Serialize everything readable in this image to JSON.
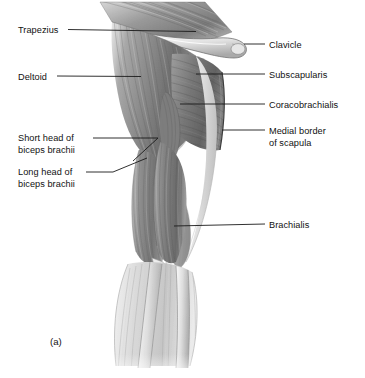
{
  "figure": {
    "letter": "(a)",
    "background_color": "#ffffff",
    "ink_color": "#1a1a1a"
  },
  "labels_left": [
    {
      "name": "trapezius",
      "lines": [
        "Trapezius"
      ],
      "x": 18,
      "y": 25,
      "leader": "M68,29.5 L196,31.5"
    },
    {
      "name": "deltoid",
      "lines": [
        "Deltoid"
      ],
      "x": 18,
      "y": 72,
      "leader": "M57,76 L141,76.5"
    },
    {
      "name": "short-head-of-biceps-brachii",
      "lines": [
        "Short head of",
        "biceps brachii"
      ],
      "x": 18,
      "y": 133,
      "leader": "M93,138 L158,138 L133,161"
    },
    {
      "name": "long-head-of-biceps-brachii",
      "lines": [
        "Long head of",
        "biceps brachii"
      ],
      "x": 18,
      "y": 167,
      "leader": "M86,172 L113,172 L147,158"
    }
  ],
  "labels_right": [
    {
      "name": "clavicle",
      "lines": [
        "Clavicle"
      ],
      "x": 269,
      "y": 40,
      "leader": "M244,44 L265,44"
    },
    {
      "name": "subscapularis",
      "lines": [
        "Subscapularis"
      ],
      "x": 269,
      "y": 70,
      "leader": "M196,74 L265,74"
    },
    {
      "name": "coracobrachialis",
      "lines": [
        "Coracobrachialis"
      ],
      "x": 269,
      "y": 100,
      "leader": "M180,104 L265,104"
    },
    {
      "name": "medial-border-of-scapula",
      "lines": [
        "Medial border",
        "of scapula"
      ],
      "x": 269,
      "y": 126,
      "leader": "M222,130 L265,130"
    },
    {
      "name": "brachialis",
      "lines": [
        "Brachialis"
      ],
      "x": 269,
      "y": 220,
      "leader": "M174,226 L265,224"
    }
  ],
  "anatomy_parts": [
    "trapezius",
    "clavicle",
    "deltoid",
    "subscapularis",
    "coracobrachialis",
    "medial-border-of-scapula",
    "short-head-of-biceps-brachii",
    "long-head-of-biceps-brachii",
    "brachialis",
    "forearm-radius",
    "forearm-ulna",
    "biceps-tendon"
  ]
}
